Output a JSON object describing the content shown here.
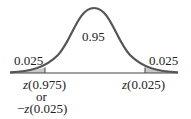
{
  "diagram": {
    "type": "normal-distribution",
    "center_area": "0.95",
    "left_tail_area": "0.025",
    "right_tail_area": "0.025",
    "left_cut_label": {
      "z": "z",
      "arg": "(0.975)",
      "or": "or",
      "neg": "−",
      "z2": "z",
      "arg2": "(0.025)"
    },
    "right_cut_label": {
      "z": "z",
      "arg": "(0.025)"
    },
    "colors": {
      "curve": "#555555",
      "shade": "#c8c8c8",
      "axis": "#444444"
    }
  }
}
